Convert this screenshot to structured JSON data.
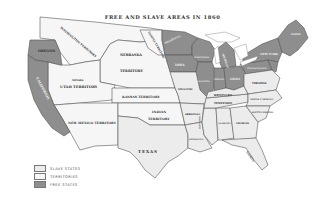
{
  "title": "FREE AND SLAVE AREAS IN 1860",
  "colors": {
    "slave_states": "#ececec",
    "territories": "#f6f6f6",
    "free_states": "#8e8e8e",
    "border": "#555555",
    "background": "#ffffff"
  },
  "legend": {
    "items": [
      {
        "label": "SLAVE STATES",
        "color": "#ececec"
      },
      {
        "label": "TERRITORIES",
        "color": "#f6f6f6"
      },
      {
        "label": "FREE STATES",
        "color": "#8e8e8e"
      }
    ]
  },
  "regions": {
    "washington": "WASHINGTON TERRITORY",
    "oregon": "OREGON",
    "california": "CALIFORNIA",
    "utah": "UTAH TERRITORY",
    "nevada": "NEVADA",
    "new_mexico": "NEW MEXICO TERRITORY",
    "nebraska": "NEBRASKA",
    "nebraska_territory": "TERRITORY",
    "dakota": "DAKOTA TERRITORY",
    "kansas": "KANSAS TERRITORY",
    "indian": "INDIAN",
    "indian_territory": "TERRITORY",
    "texas": "TEXAS",
    "minnesota": "MINNESOTA",
    "iowa": "IOWA",
    "wisconsin": "WISCONSIN",
    "illinois": "ILLINOIS",
    "michigan": "MICHIGAN",
    "indiana": "INDIANA",
    "ohio": "OHIO",
    "missouri": "MISSOURI",
    "arkansas": "ARKANSAS",
    "louisiana": "LOUISIANA",
    "mississippi": "MISSISSIPPI",
    "alabama": "ALABAMA",
    "georgia": "GEORGIA",
    "florida": "FLORIDA",
    "tennessee": "TENNESSEE",
    "kentucky": "KENTUCKY",
    "virginia": "VIRGINIA",
    "north_carolina": "NORTH CAROLINA",
    "south_carolina": "SOUTH CAROLINA",
    "pennsylvania": "PENNSYLVANIA",
    "new_york": "NEW YORK",
    "maine": "MAINE"
  }
}
